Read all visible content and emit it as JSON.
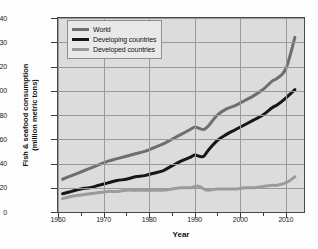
{
  "chart_data": {
    "type": "line",
    "title": "",
    "xlabel": "Year",
    "ylabel_line1": "Fish & seafood consumption",
    "ylabel_line2": "(million metric tons)",
    "xlim": [
      1960,
      2014
    ],
    "ylim": [
      0,
      140
    ],
    "grid": true,
    "legend_position": "top-left",
    "xticks": [
      "1960",
      "1970",
      "1980",
      "1990",
      "2000",
      "2010"
    ],
    "xtick_values": [
      1960,
      1970,
      1980,
      1990,
      2000,
      2010
    ],
    "yticks": [
      "0",
      "20",
      "40",
      "60",
      "80",
      "100",
      "120",
      "130",
      "140"
    ],
    "ytick_values": [
      0,
      20,
      40,
      60,
      80,
      100,
      120,
      130,
      140
    ],
    "colors": {
      "world": "#6e6e6e",
      "developing": "#161616",
      "developed": "#9b9b9b",
      "plot_background": "#dcdcdc",
      "gridline": "#9a9a9a",
      "axis": "#4a4a4a"
    },
    "x": [
      1961,
      1963,
      1965,
      1967,
      1969,
      1971,
      1973,
      1975,
      1977,
      1979,
      1981,
      1983,
      1985,
      1987,
      1989,
      1990,
      1991,
      1992,
      1993,
      1995,
      1997,
      1999,
      2001,
      2003,
      2005,
      2007,
      2008,
      2010,
      2012
    ],
    "series": [
      {
        "name": "World",
        "color": "#6e6e6e",
        "values": [
          27,
          30,
          33,
          36,
          39,
          42,
          44,
          46,
          48,
          50,
          53,
          56,
          60,
          64,
          68,
          70,
          69,
          68,
          71,
          80,
          85,
          88,
          92,
          96,
          101,
          108,
          110,
          118,
          132
        ]
      },
      {
        "name": "Developing countries",
        "color": "#161616",
        "values": [
          15,
          17,
          19,
          20,
          22,
          24,
          26,
          27,
          29,
          30,
          32,
          34,
          38,
          42,
          45,
          47,
          46,
          46,
          51,
          59,
          64,
          68,
          72,
          76,
          80,
          86,
          88,
          94,
          101
        ]
      },
      {
        "name": "Developed countries",
        "color": "#9b9b9b",
        "values": [
          11,
          13,
          14,
          15,
          16,
          17,
          17,
          18,
          18,
          18,
          18,
          18,
          19,
          20,
          20,
          21,
          21,
          19,
          18,
          19,
          19,
          19,
          20,
          20,
          21,
          22,
          22,
          24,
          29
        ]
      }
    ]
  },
  "legend": {
    "items": [
      {
        "label": "World"
      },
      {
        "label": "Developing countries"
      },
      {
        "label": "Developed countries"
      }
    ]
  }
}
